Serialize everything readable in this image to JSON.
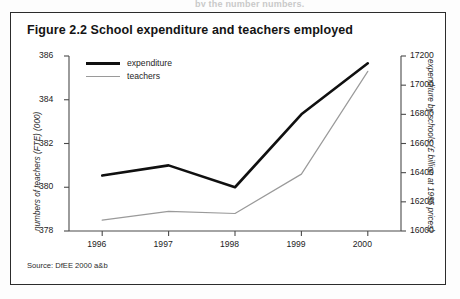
{
  "page": {
    "top_bleed_text": "by the number numbers."
  },
  "figure": {
    "title": "Figure 2.2 School expenditure and teachers employed",
    "source": "Source: DfEE 2000 a&b"
  },
  "legend": {
    "position": "top-left-inside",
    "items": [
      {
        "label": "expenditure",
        "color": "#101010",
        "style": "thick-solid"
      },
      {
        "label": "teachers",
        "color": "#9a9a9a",
        "style": "thin-solid"
      }
    ]
  },
  "axes": {
    "left_title": "numbers of teachers (FTE) (000)",
    "right_title": "expenditure by schools (£ billion at 1995 prices)",
    "left_ticks": [
      "378",
      "380",
      "382",
      "384",
      "386"
    ],
    "right_ticks": [
      "16000",
      "16200",
      "16400",
      "16600",
      "16800",
      "17000",
      "17200"
    ],
    "x_ticks": [
      "1996",
      "1997",
      "1998",
      "1999",
      "2000"
    ]
  },
  "chart_data": {
    "type": "line",
    "title": "Figure 2.2 School expenditure and teachers employed",
    "xlabel": "",
    "ylabel": "numbers of teachers (FTE) (000)",
    "y2label": "expenditure by schools (£ billion at 1995 prices)",
    "categories": [
      "1996",
      "1997",
      "1998",
      "1999",
      "2000"
    ],
    "x": [
      1996,
      1997,
      1998,
      1999,
      2000
    ],
    "ylim": [
      378,
      386
    ],
    "y2lim": [
      16000,
      17200
    ],
    "yticks": [
      378,
      380,
      382,
      384,
      386
    ],
    "y2ticks": [
      16000,
      16200,
      16400,
      16600,
      16800,
      17000,
      17200
    ],
    "grid": false,
    "legend_position": "upper left",
    "series": [
      {
        "name": "expenditure",
        "axis": "right",
        "color": "#101010",
        "linewidth": 2.6,
        "values": [
          16380,
          16450,
          16300,
          16800,
          17150
        ]
      },
      {
        "name": "teachers",
        "axis": "left",
        "color": "#9a9a9a",
        "linewidth": 1.2,
        "values": [
          378.5,
          378.9,
          378.8,
          380.6,
          385.3
        ]
      }
    ]
  }
}
